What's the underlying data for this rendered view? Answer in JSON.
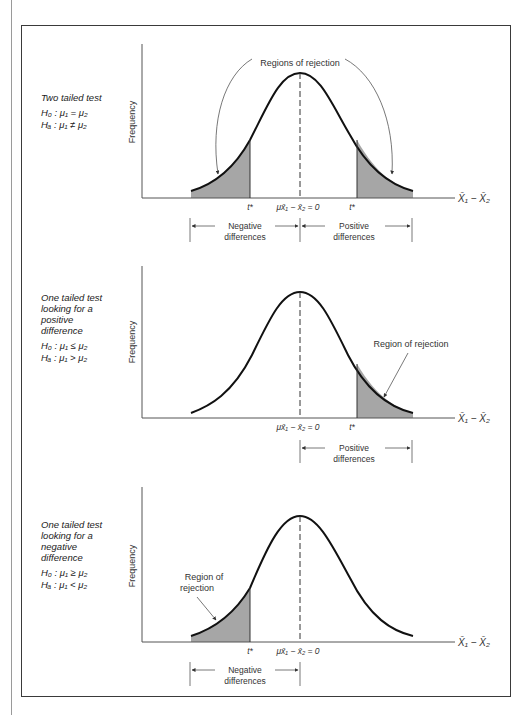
{
  "figure": {
    "panels": [
      {
        "id": "two-tailed",
        "title_lines": [
          "Two tailed test"
        ],
        "h0": "H₀ : μ₁ = μ₂",
        "ha": "Hₐ : μ₁ ≠ μ₂",
        "ylabel": "Frequency",
        "xlabel": "X̄₁ − X̄₂",
        "mean_label": "μx̄₁ − x̄₂ = 0",
        "critical_label": "t*",
        "annotation": "Regions of rejection",
        "bracket_left": [
          "Negative",
          "differences"
        ],
        "bracket_right": [
          "Positive",
          "differences"
        ]
      },
      {
        "id": "one-tailed-positive",
        "title_lines": [
          "One tailed test",
          "looking for a",
          "positive",
          "difference"
        ],
        "h0": "H₀ : μ₁ ≤ μ₂",
        "ha": "Hₐ : μ₁ > μ₂",
        "ylabel": "Frequency",
        "xlabel": "X̄₁ − X̄₂",
        "mean_label": "μx̄₁ − x̄₂ = 0",
        "critical_label": "t*",
        "annotation": "Region of rejection",
        "bracket_right": [
          "Positive",
          "differences"
        ]
      },
      {
        "id": "one-tailed-negative",
        "title_lines": [
          "One tailed test",
          "looking for a",
          "negative",
          "difference"
        ],
        "h0": "H₀ : μ₁ ≥ μ₂",
        "ha": "Hₐ : μ₁ < μ₂",
        "ylabel": "Frequency",
        "xlabel": "X̄₁ − X̄₂",
        "mean_label": "μx̄₁ − x̄₂ = 0",
        "critical_label": "t*",
        "annotation_lines": [
          "Region of",
          "rejection"
        ],
        "bracket_left": [
          "Negative",
          "differences"
        ]
      }
    ]
  },
  "colors": {
    "shade": "#a6a6a6",
    "curve": "#111111",
    "axis": "#555555",
    "frame": "#3a3a3a"
  }
}
